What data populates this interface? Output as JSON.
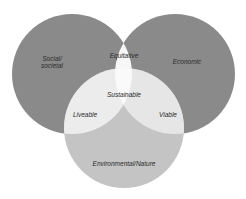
{
  "diagram": {
    "type": "venn",
    "sets": [
      {
        "id": "social",
        "label": "Social/\nsocietal",
        "color": "#8a8a8a"
      },
      {
        "id": "economic",
        "label": "Economic",
        "color": "#8a8a8a"
      },
      {
        "id": "environmental",
        "label": "Environmental/Nature",
        "color": "#c4c4c4"
      }
    ],
    "intersections": {
      "social_economic": "Equitative",
      "social_environmental": "Liveable",
      "economic_environmental": "Viable",
      "all": "Sustainable"
    },
    "colors": {
      "background": "#ffffff",
      "outer_circle": "#8a8a8a",
      "bottom_circle": "#c4c4c4",
      "pair_overlap_top": "#f7f7f7",
      "pair_overlap_side": "#ececec",
      "center_overlap": "#fafafa",
      "text": "#2a2a2a"
    }
  }
}
